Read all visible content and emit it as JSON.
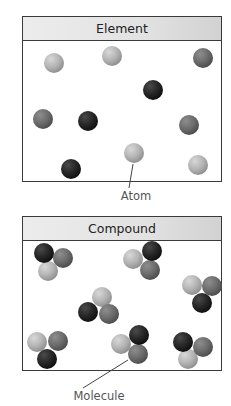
{
  "element_panel": {
    "title": "Element",
    "atoms": [
      {
        "x": 54,
        "y": 63,
        "shade": "light"
      },
      {
        "x": 112,
        "y": 56,
        "shade": "light"
      },
      {
        "x": 203,
        "y": 58,
        "shade": "medium"
      },
      {
        "x": 153,
        "y": 90,
        "shade": "dark"
      },
      {
        "x": 43,
        "y": 119,
        "shade": "medium"
      },
      {
        "x": 88,
        "y": 121,
        "shade": "dark"
      },
      {
        "x": 189,
        "y": 125,
        "shade": "medium"
      },
      {
        "x": 134,
        "y": 153,
        "shade": "light"
      },
      {
        "x": 71,
        "y": 169,
        "shade": "dark"
      },
      {
        "x": 198,
        "y": 165,
        "shade": "light"
      }
    ],
    "callout": {
      "label": "Atom",
      "x1": 133,
      "y1": 164,
      "x2": 129,
      "y2": 188,
      "label_x": 136,
      "label_y": 196
    }
  },
  "compound_panel": {
    "title": "Compound",
    "molecules": [
      [
        {
          "x": 48,
          "y": 271,
          "shade": "light"
        },
        {
          "x": 63,
          "y": 258,
          "shade": "medium"
        },
        {
          "x": 44,
          "y": 253,
          "shade": "dark"
        }
      ],
      [
        {
          "x": 133,
          "y": 259,
          "shade": "light"
        },
        {
          "x": 150,
          "y": 270,
          "shade": "medium"
        },
        {
          "x": 152,
          "y": 251,
          "shade": "dark"
        }
      ],
      [
        {
          "x": 192,
          "y": 285,
          "shade": "light"
        },
        {
          "x": 212,
          "y": 286,
          "shade": "medium"
        },
        {
          "x": 202,
          "y": 303,
          "shade": "dark"
        }
      ],
      [
        {
          "x": 102,
          "y": 297,
          "shade": "light"
        },
        {
          "x": 109,
          "y": 314,
          "shade": "medium"
        },
        {
          "x": 88,
          "y": 312,
          "shade": "dark"
        }
      ],
      [
        {
          "x": 37,
          "y": 342,
          "shade": "light"
        },
        {
          "x": 58,
          "y": 341,
          "shade": "medium"
        },
        {
          "x": 47,
          "y": 359,
          "shade": "dark"
        }
      ],
      [
        {
          "x": 121,
          "y": 344,
          "shade": "light"
        },
        {
          "x": 138,
          "y": 354,
          "shade": "medium"
        },
        {
          "x": 139,
          "y": 335,
          "shade": "dark"
        }
      ],
      [
        {
          "x": 188,
          "y": 359,
          "shade": "light"
        },
        {
          "x": 203,
          "y": 347,
          "shade": "medium"
        },
        {
          "x": 183,
          "y": 342,
          "shade": "dark"
        }
      ]
    ],
    "callout": {
      "label": "Molecule",
      "x1": 128,
      "y1": 360,
      "x2": 83,
      "y2": 388,
      "label_x": 99,
      "label_y": 396
    }
  },
  "shades": {
    "light": {
      "hi": "#d8d8d8",
      "mid": "#b4b4b4",
      "lo": "#8c8c8c"
    },
    "medium": {
      "hi": "#8e8e8e",
      "mid": "#6c6c6c",
      "lo": "#4a4a4a"
    },
    "dark": {
      "hi": "#4a4a4a",
      "mid": "#262626",
      "lo": "#0e0e0e"
    }
  },
  "atom_radius": 10
}
